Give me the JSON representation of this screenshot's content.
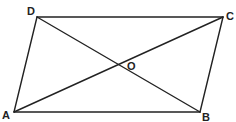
{
  "diagram": {
    "stroke_color": "#222222",
    "vertices": {
      "A": {
        "label": "A",
        "x": 14,
        "y": 112
      },
      "B": {
        "label": "B",
        "x": 200,
        "y": 112
      },
      "C": {
        "label": "C",
        "x": 223,
        "y": 17
      },
      "D": {
        "label": "D",
        "x": 37,
        "y": 17
      }
    },
    "intersection": {
      "label": "O",
      "x": 118,
      "y": 65
    },
    "edges": [
      {
        "from": "A",
        "to": "B"
      },
      {
        "from": "B",
        "to": "C"
      },
      {
        "from": "C",
        "to": "D"
      },
      {
        "from": "D",
        "to": "A"
      }
    ],
    "diagonals": [
      {
        "from": "A",
        "to": "C"
      },
      {
        "from": "D",
        "to": "B"
      }
    ]
  }
}
